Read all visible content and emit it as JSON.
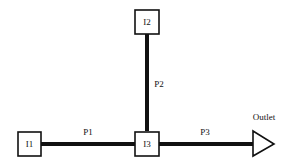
{
  "nodes": {
    "i1": {
      "label": "I1"
    },
    "i2": {
      "label": "I2"
    },
    "i3": {
      "label": "I3"
    },
    "outlet": {
      "label": "Outlet"
    }
  },
  "pipes": {
    "p1": {
      "label": "P1",
      "from": "I1",
      "to": "I3"
    },
    "p2": {
      "label": "P2",
      "from": "I2",
      "to": "I3"
    },
    "p3": {
      "label": "P3",
      "from": "I3",
      "to": "Outlet"
    }
  },
  "colors": {
    "line": "#111111",
    "background": "#ffffff"
  }
}
